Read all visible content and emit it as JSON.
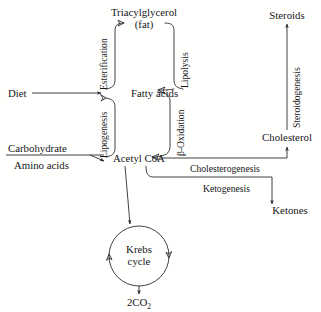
{
  "diagram": {
    "background_color": "#ffffff",
    "line_color": "#2b2b30",
    "text_color": "#16161a",
    "nodes": {
      "triacylglycerol_line1": "Triacylglycerol",
      "triacylglycerol_line2": "(fat)",
      "diet": "Diet",
      "fatty_acids": "Fatty acids",
      "carbohydrate": "Carbohydrate",
      "amino_acids": "Amino acids",
      "acetyl_coa": "Acetyl CoA",
      "krebs_line1": "Krebs",
      "krebs_line2": "cycle",
      "co2_main": "2CO",
      "co2_sub": "2",
      "steroids": "Steroids",
      "cholesterol": "Cholesterol",
      "ketones": "Ketones"
    },
    "edge_labels": {
      "esterification": "Esterification",
      "lipolysis": "Lipolysis",
      "lipogenesis": "Lipogenesis",
      "beta_oxidation": "β-Oxidation",
      "steroidogenesis": "Steroidogenesis",
      "cholesterogenesis": "Cholesterogenesis",
      "ketogenesis": "Ketogenesis"
    }
  }
}
